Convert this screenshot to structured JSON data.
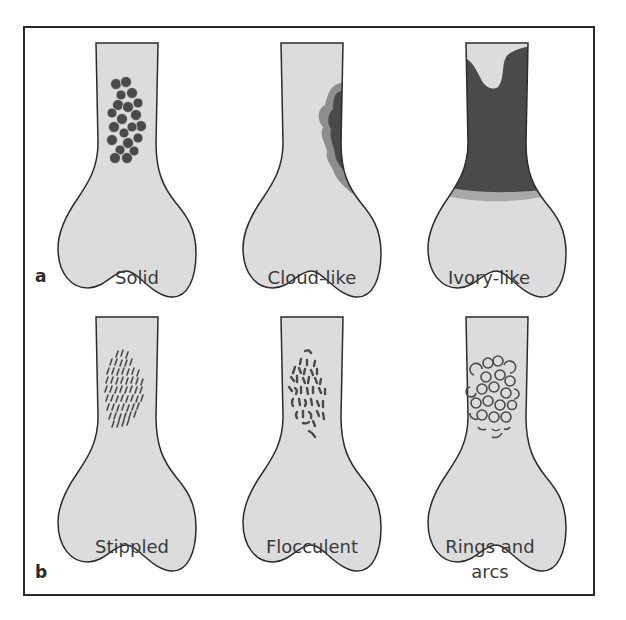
{
  "figure": {
    "colors": {
      "bone_fill": "#dcdcdc",
      "bone_outline": "#2b2b2b",
      "lesion_dark": "#4a4a4a",
      "lesion_halo": "#8e8e8e",
      "frame": "#2a2a2a"
    },
    "panels": [
      {
        "letter": "a",
        "row": 1
      },
      {
        "letter": "b",
        "row": 2
      }
    ],
    "items": [
      {
        "label": "Solid",
        "pattern": "solid-nodules"
      },
      {
        "label": "Cloud-like",
        "pattern": "cloud-like"
      },
      {
        "label": "Ivory-like",
        "pattern": "ivory-like"
      },
      {
        "label": "Stippled",
        "pattern": "stippled"
      },
      {
        "label": "Flocculent",
        "pattern": "flocculent"
      },
      {
        "label": "Rings and",
        "label_line2": "arcs",
        "pattern": "rings-and-arcs"
      }
    ]
  }
}
